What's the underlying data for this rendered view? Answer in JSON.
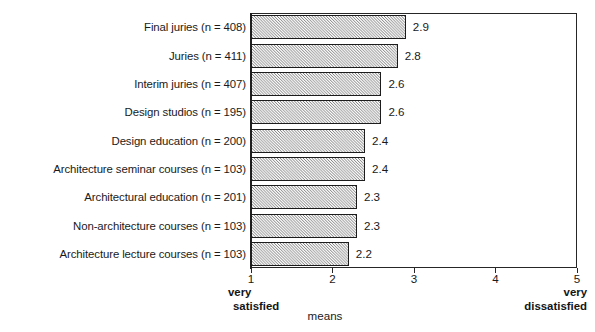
{
  "chart_data": {
    "type": "bar",
    "orientation": "horizontal",
    "title": "",
    "xlabel": "means",
    "ylabel": "",
    "xlim": [
      1,
      5
    ],
    "grid": false,
    "legend": null,
    "xticks": [
      "1",
      "2",
      "3",
      "4",
      "5"
    ],
    "categories": [
      "Final juries (n = 408)",
      "Juries (n = 411)",
      "Interim juries (n = 407)",
      "Design studios (n = 195)",
      "Design education (n = 200)",
      "Architecture seminar courses  (n = 103)",
      "Architectural education  (n = 201)",
      "Non-architecture courses  (n = 103)",
      "Architecture lecture courses  (n = 103)"
    ],
    "values": [
      2.9,
      2.8,
      2.6,
      2.6,
      2.4,
      2.4,
      2.3,
      2.3,
      2.2
    ],
    "value_labels": [
      "2.9",
      "2.8",
      "2.6",
      "2.6",
      "2.4",
      "2.4",
      "2.3",
      "2.3",
      "2.2"
    ],
    "scale_anchor_low": "very\nsatisfied",
    "scale_anchor_low_line1": "very",
    "scale_anchor_low_line2": "satisfied",
    "scale_anchor_high_line1": "very",
    "scale_anchor_high_line2": "dissatisfied",
    "bar_fill_color": "#c9c9c9",
    "bar_edge_color": "#1c1c1c",
    "axis_color": "#262626"
  }
}
